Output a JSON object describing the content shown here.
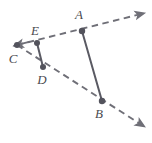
{
  "figure": {
    "width": 152,
    "height": 143,
    "background_color": "#ffffff",
    "dashed_line_color": "#6f6f77",
    "solid_line_color": "#5a5a63",
    "point_color": "#53535c",
    "label_color": "#4a4a4f",
    "points": [
      {
        "id": "A",
        "label": "A",
        "x": 82,
        "y": 31,
        "label_x": 79,
        "label_y": 14,
        "dot_r": 3.2
      },
      {
        "id": "B",
        "label": "B",
        "x": 102,
        "y": 101,
        "label_x": 99,
        "label_y": 113,
        "dot_r": 3.2
      },
      {
        "id": "C",
        "label": "C",
        "x": 17,
        "y": 45,
        "label_x": 13,
        "label_y": 58,
        "dot_r": 3.0
      },
      {
        "id": "D",
        "label": "D",
        "x": 43,
        "y": 67,
        "label_x": 42,
        "label_y": 79,
        "dot_r": 3.0
      },
      {
        "id": "E",
        "label": "E",
        "x": 37,
        "y": 43,
        "label_x": 35,
        "label_y": 30,
        "dot_r": 3.0
      }
    ],
    "dashed_rays": [
      {
        "id": "ray-CEA",
        "name": "ray-through-C-E-A",
        "from": "C",
        "through": [
          "E",
          "A"
        ],
        "start_x": 17,
        "start_y": 45,
        "end_x": 145,
        "end_y": 13,
        "arrow_start": true,
        "arrow_end": true
      },
      {
        "id": "ray-CDB",
        "name": "ray-through-C-D-B",
        "from": "C",
        "through": [
          "D",
          "B"
        ],
        "start_x": 17,
        "start_y": 45,
        "end_x": 145,
        "end_y": 127,
        "arrow_start": false,
        "arrow_end": true
      }
    ],
    "solid_segments": [
      {
        "id": "seg-AB",
        "name": "segment-A-B",
        "x1": 82,
        "y1": 31,
        "x2": 102,
        "y2": 101
      },
      {
        "id": "seg-ED",
        "name": "segment-E-D",
        "x1": 37,
        "y1": 43,
        "x2": 43,
        "y2": 67
      }
    ]
  }
}
